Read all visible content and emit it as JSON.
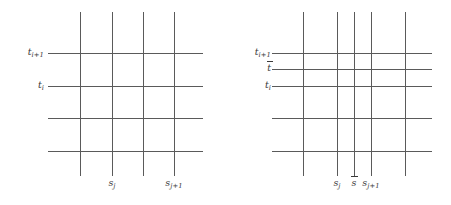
{
  "figure": {
    "line_color": "#5a5a5a",
    "text_color": "#3a3a3a",
    "background": "#ffffff",
    "panels": [
      {
        "id": "left-grid",
        "name": "coarse-grid",
        "vertical_lines_x": [
          80,
          112,
          143,
          174
        ],
        "horizontal_lines_y": [
          53,
          86,
          118,
          151
        ],
        "vertical_extent_y": [
          12,
          176
        ],
        "horizontal_extent_x": [
          48,
          203
        ],
        "t_labels": [
          {
            "id": "t-i-plus-1",
            "base": "t",
            "sub": "i+1",
            "bar": false,
            "y": 53,
            "x_right": 48
          },
          {
            "id": "t-i",
            "base": "t",
            "sub": "i",
            "bar": false,
            "y": 86,
            "x_right": 48
          }
        ],
        "s_labels": [
          {
            "id": "s-j",
            "base": "s",
            "sub": "j",
            "bar": false,
            "x": 112,
            "y": 184
          },
          {
            "id": "s-j-plus-1",
            "base": "s",
            "sub": "j+1",
            "bar": false,
            "x": 174,
            "y": 184
          }
        ]
      },
      {
        "id": "right-grid",
        "name": "refined-grid",
        "vertical_lines_x": [
          303,
          337,
          354,
          371,
          405
        ],
        "horizontal_lines_y": [
          53,
          69,
          86,
          118,
          151
        ],
        "vertical_extent_y": [
          12,
          176
        ],
        "horizontal_extent_x": [
          272,
          432
        ],
        "t_labels": [
          {
            "id": "t-i-plus-1",
            "base": "t",
            "sub": "i+1",
            "bar": false,
            "y": 53,
            "x_right": 272
          },
          {
            "id": "t-bar",
            "base": "t",
            "sub": "",
            "bar": true,
            "y": 69,
            "x_right": 272
          },
          {
            "id": "t-i",
            "base": "t",
            "sub": "i",
            "bar": false,
            "y": 86,
            "x_right": 272
          }
        ],
        "s_labels": [
          {
            "id": "s-j",
            "base": "s",
            "sub": "j",
            "bar": false,
            "x": 337,
            "y": 184
          },
          {
            "id": "s-bar",
            "base": "s",
            "sub": "",
            "bar": true,
            "x": 354,
            "y": 184
          },
          {
            "id": "s-j-plus-1",
            "base": "s",
            "sub": "j+1",
            "bar": false,
            "x": 371,
            "y": 184
          }
        ]
      }
    ]
  },
  "labels": {
    "left": {
      "t_i_plus_1_base": "t",
      "t_i_plus_1_sub": "i+1",
      "t_i_base": "t",
      "t_i_sub": "i",
      "s_j_base": "s",
      "s_j_sub": "j",
      "s_j_plus_1_base": "s",
      "s_j_plus_1_sub": "j+1"
    },
    "right": {
      "t_i_plus_1_base": "t",
      "t_i_plus_1_sub": "i+1",
      "t_bar_base": "t",
      "t_i_base": "t",
      "t_i_sub": "i",
      "s_j_base": "s",
      "s_j_sub": "j",
      "s_bar_base": "s",
      "s_j_plus_1_base": "s",
      "s_j_plus_1_sub": "j+1"
    }
  }
}
